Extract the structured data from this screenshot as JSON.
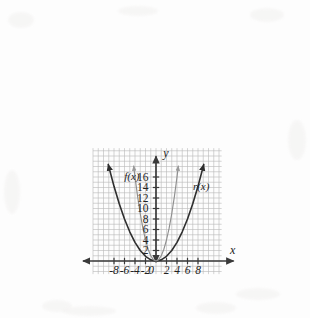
{
  "figure": {
    "kind": "cartesian-graph",
    "background_color": "#fdfdfd",
    "grid_color": "#b9b9b9",
    "axis_color": "#3a3a3a",
    "curve_colors": {
      "f": "#8f8f8f",
      "r": "#2e2e2e"
    }
  },
  "axes": {
    "x_axis_label": "x",
    "y_axis_label": "y",
    "x_ticks": [
      "-8",
      "-6",
      "-4",
      "-2",
      "0",
      "2",
      "4",
      "6",
      "8"
    ],
    "y_ticks": [
      "2",
      "4",
      "6",
      "8",
      "10",
      "12",
      "14",
      "16"
    ],
    "x_tick_values": [
      -8,
      -6,
      -4,
      -2,
      0,
      2,
      4,
      6,
      8
    ],
    "y_tick_values": [
      2,
      4,
      6,
      8,
      10,
      12,
      14,
      16
    ],
    "origin_label": "0"
  },
  "curve_labels": {
    "f": "f(x)",
    "r": "r(x)"
  },
  "chart_data": {
    "type": "line",
    "title": "",
    "xlabel": "x",
    "ylabel": "y",
    "xlim": [
      -12,
      12.5
    ],
    "ylim": [
      -2.5,
      22
    ],
    "grid": true,
    "legend": "inline-curve-labels",
    "xticks": [
      -8,
      -6,
      -4,
      -2,
      0,
      2,
      4,
      6,
      8
    ],
    "yticks": [
      2,
      4,
      6,
      8,
      10,
      12,
      14,
      16
    ],
    "series": [
      {
        "name": "f(x)",
        "label": "f(x)",
        "equation": "y = x^2",
        "color": "#8f8f8f",
        "arrowheads": "both-ends-up",
        "x_domain": [
          -4.25,
          4.25
        ],
        "points": [
          {
            "x": -4.25,
            "y": 18.06
          },
          {
            "x": -4.0,
            "y": 16.0
          },
          {
            "x": -3.5,
            "y": 12.25
          },
          {
            "x": -3.0,
            "y": 9.0
          },
          {
            "x": -2.5,
            "y": 6.25
          },
          {
            "x": -2.0,
            "y": 4.0
          },
          {
            "x": -1.5,
            "y": 2.25
          },
          {
            "x": -1.0,
            "y": 1.0
          },
          {
            "x": -0.5,
            "y": 0.25
          },
          {
            "x": 0.0,
            "y": 0.0
          },
          {
            "x": 0.5,
            "y": 0.25
          },
          {
            "x": 1.0,
            "y": 1.0
          },
          {
            "x": 1.5,
            "y": 2.25
          },
          {
            "x": 2.0,
            "y": 4.0
          },
          {
            "x": 2.5,
            "y": 6.25
          },
          {
            "x": 3.0,
            "y": 9.0
          },
          {
            "x": 3.5,
            "y": 12.25
          },
          {
            "x": 4.0,
            "y": 16.0
          },
          {
            "x": 4.25,
            "y": 18.06
          }
        ]
      },
      {
        "name": "r(x)",
        "label": "r(x)",
        "equation": "y = x^2/4.5",
        "color": "#2e2e2e",
        "arrowheads": "both-ends-up",
        "x_domain": [
          -9.1,
          9.1
        ],
        "points": [
          {
            "x": -9.1,
            "y": 18.4
          },
          {
            "x": -8.0,
            "y": 14.22
          },
          {
            "x": -7.0,
            "y": 10.89
          },
          {
            "x": -6.0,
            "y": 8.0
          },
          {
            "x": -5.0,
            "y": 5.56
          },
          {
            "x": -4.0,
            "y": 3.56
          },
          {
            "x": -3.0,
            "y": 2.0
          },
          {
            "x": -2.0,
            "y": 0.89
          },
          {
            "x": -1.0,
            "y": 0.22
          },
          {
            "x": 0.0,
            "y": 0.0
          },
          {
            "x": 1.0,
            "y": 0.22
          },
          {
            "x": 2.0,
            "y": 0.89
          },
          {
            "x": 3.0,
            "y": 2.0
          },
          {
            "x": 4.0,
            "y": 3.56
          },
          {
            "x": 5.0,
            "y": 5.56
          },
          {
            "x": 6.0,
            "y": 8.0
          },
          {
            "x": 7.0,
            "y": 10.89
          },
          {
            "x": 8.0,
            "y": 14.22
          },
          {
            "x": 9.1,
            "y": 18.4
          }
        ]
      }
    ],
    "annotations": [
      {
        "text": "f(x)",
        "x": -4.6,
        "y": 15.4
      },
      {
        "text": "r(x)",
        "x": 8.6,
        "y": 13.6
      }
    ]
  }
}
